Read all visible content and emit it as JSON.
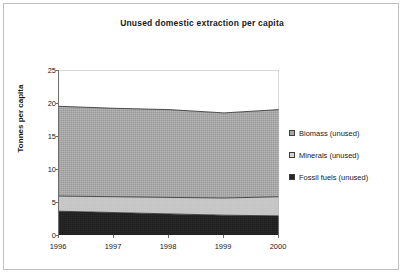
{
  "chart_data": {
    "type": "area",
    "title": "Unused domestic extraction per capita",
    "xlabel": "",
    "ylabel": "Tonnes per capita",
    "x": [
      "1996",
      "1997",
      "1998",
      "1999",
      "2000"
    ],
    "categories": [
      "1996",
      "1997",
      "1998",
      "1999",
      "2000"
    ],
    "stacked": true,
    "ylim": [
      0,
      25
    ],
    "yticks": [
      "0",
      "5",
      "10",
      "15",
      "20",
      "25"
    ],
    "xticks": [
      "1996",
      "1997",
      "1998",
      "1999",
      "2000"
    ],
    "grid": false,
    "legend_position": "right",
    "series": [
      {
        "name": "Fossil fuels (unused)",
        "color": "#262626",
        "values": [
          3.6,
          3.4,
          3.2,
          3.0,
          2.9
        ]
      },
      {
        "name": "Minerals (unused)",
        "color": "#c8c8c8",
        "values": [
          2.3,
          2.4,
          2.5,
          2.6,
          2.9
        ]
      },
      {
        "name": "Biomass (unused)",
        "color": "#a8a8a8",
        "values": [
          13.6,
          13.4,
          13.3,
          12.9,
          13.2
        ]
      }
    ],
    "cumulative_tops": {
      "fossil_fuels": [
        3.6,
        3.4,
        3.2,
        3.0,
        2.9
      ],
      "minerals": [
        5.9,
        5.8,
        5.7,
        5.6,
        5.8
      ],
      "total": [
        19.5,
        19.2,
        19.0,
        18.5,
        19.0
      ]
    }
  },
  "chart": {
    "title": "Unused domestic extraction per capita",
    "y_axis_title": "Tonnes per capita",
    "y_ticks": [
      "25",
      "20",
      "15",
      "10",
      "5",
      "0"
    ],
    "x_ticks": [
      "1996",
      "1997",
      "1998",
      "1999",
      "2000"
    ]
  },
  "legend": {
    "items": [
      {
        "label": "Biomass (unused)",
        "color": "#a8a8a8"
      },
      {
        "label": "Minerals (unused)",
        "color": "#c8c8c8"
      },
      {
        "label": "Fossil fuels (unused)",
        "color": "#262626"
      }
    ]
  }
}
